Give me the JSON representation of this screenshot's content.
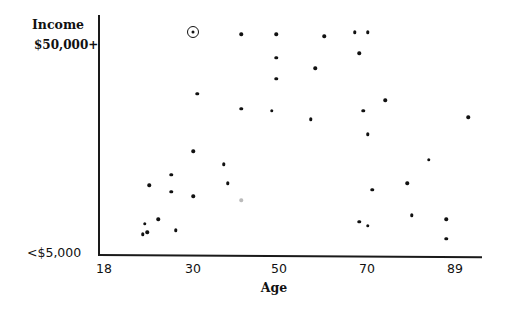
{
  "chart_data": {
    "type": "scatter",
    "title": "",
    "xlabel": "Age",
    "ylabel": "Income",
    "x_ticks": [
      "18",
      "30",
      "50",
      "70",
      "89"
    ],
    "y_ticks": [
      "<$5,000",
      "$50,000+"
    ],
    "xlim": [
      18,
      93
    ],
    "ylim_labels": [
      "<$5,000",
      "$50,000+"
    ],
    "y_scale_note": "income shown as normalized position 0 (<$5,000) to 1 ($50,000+)",
    "grid": false,
    "legend": null,
    "points": [
      {
        "age": 30,
        "income": 1.0,
        "highlighted": true
      },
      {
        "age": 41,
        "income": 0.99
      },
      {
        "age": 49,
        "income": 0.99
      },
      {
        "age": 60,
        "income": 0.98
      },
      {
        "age": 67,
        "income": 1.0
      },
      {
        "age": 70,
        "income": 1.0
      },
      {
        "age": 68,
        "income": 0.9
      },
      {
        "age": 49,
        "income": 0.88
      },
      {
        "age": 58,
        "income": 0.83
      },
      {
        "age": 49,
        "income": 0.78
      },
      {
        "age": 31,
        "income": 0.71
      },
      {
        "age": 74,
        "income": 0.68
      },
      {
        "age": 41,
        "income": 0.64
      },
      {
        "age": 48,
        "income": 0.63
      },
      {
        "age": 69,
        "income": 0.63
      },
      {
        "age": 57,
        "income": 0.59
      },
      {
        "age": 93,
        "income": 0.6
      },
      {
        "age": 70,
        "income": 0.52
      },
      {
        "age": 30,
        "income": 0.44
      },
      {
        "age": 84,
        "income": 0.4
      },
      {
        "age": 37,
        "income": 0.38
      },
      {
        "age": 25,
        "income": 0.33
      },
      {
        "age": 20,
        "income": 0.28
      },
      {
        "age": 38,
        "income": 0.29
      },
      {
        "age": 79,
        "income": 0.29
      },
      {
        "age": 25,
        "income": 0.25
      },
      {
        "age": 71,
        "income": 0.26
      },
      {
        "age": 30,
        "income": 0.23
      },
      {
        "age": 41,
        "income": 0.21,
        "faint": true
      },
      {
        "age": 80,
        "income": 0.14
      },
      {
        "age": 22,
        "income": 0.12
      },
      {
        "age": 68,
        "income": 0.11
      },
      {
        "age": 88,
        "income": 0.12
      },
      {
        "age": 70,
        "income": 0.09
      },
      {
        "age": 19,
        "income": 0.1
      },
      {
        "age": 26,
        "income": 0.07
      },
      {
        "age": 19.5,
        "income": 0.06
      },
      {
        "age": 18.5,
        "income": 0.05
      },
      {
        "age": 88,
        "income": 0.03
      }
    ]
  },
  "labels": {
    "y_title": "Income",
    "y_top": "$50,000+",
    "y_bottom": "<$5,000",
    "x_title": "Age",
    "x_ticks": [
      {
        "label": "18",
        "px": 104
      },
      {
        "label": "30",
        "px": 193
      },
      {
        "label": "50",
        "px": 279
      },
      {
        "label": "70",
        "px": 367
      },
      {
        "label": "89",
        "px": 455
      }
    ]
  }
}
